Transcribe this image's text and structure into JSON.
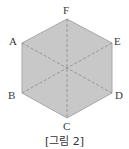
{
  "figure": {
    "caption": "[그림 2]",
    "shape": "regular-hexagon",
    "fill_color": "#c8c8c8",
    "edge_color": "#a8a8a8",
    "diagonal_color": "#8a8a8a",
    "vertices": [
      {
        "label": "F",
        "x": 67,
        "y": 19
      },
      {
        "label": "E",
        "x": 112,
        "y": 43
      },
      {
        "label": "D",
        "x": 112,
        "y": 93
      },
      {
        "label": "C",
        "x": 67,
        "y": 118
      },
      {
        "label": "B",
        "x": 22,
        "y": 93
      },
      {
        "label": "A",
        "x": 22,
        "y": 43
      }
    ],
    "dashed_diagonals": [
      "F-C",
      "A-D",
      "B-E"
    ],
    "labels": {
      "F": "F",
      "E": "E",
      "D": "D",
      "C": "C",
      "B": "B",
      "A": "A"
    }
  }
}
